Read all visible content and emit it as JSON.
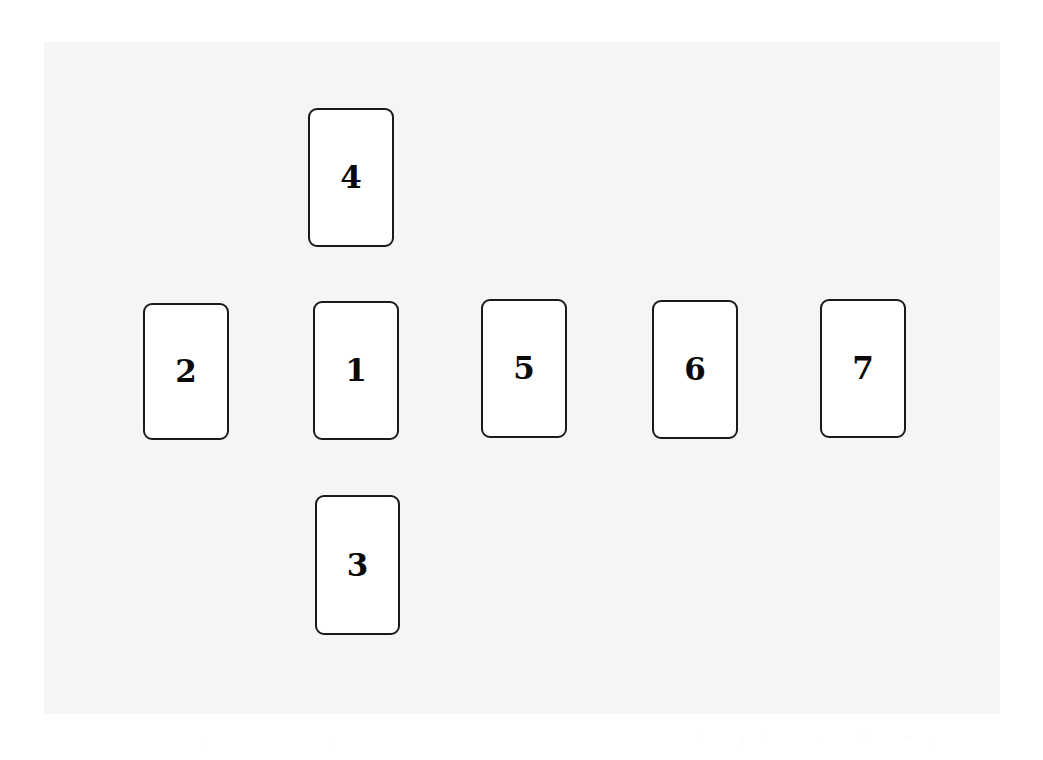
{
  "scene": {
    "type": "card-spread",
    "description": "Seven numbered rectangular cards arranged in a cross layout on a light gray surface",
    "canvas": {
      "width": 1043,
      "height": 760,
      "background_color": "#ffffff"
    },
    "board": {
      "name": "table-surface",
      "background_color": "#f5f5f5",
      "x": 44,
      "y": 42,
      "width": 956,
      "height": 672
    },
    "card_style": {
      "background_color": "#ffffff",
      "border_color": "#1a1a1a",
      "border_width": 2,
      "corner_radius": 9,
      "width": 86,
      "height": 139,
      "label_color": "#0a0a0a",
      "label_font_size": 31
    }
  },
  "cards": [
    {
      "id": "card-4",
      "label": "4",
      "x": 308,
      "y": 108,
      "width": 86,
      "height": 139,
      "column": "center",
      "row": "top"
    },
    {
      "id": "card-2",
      "label": "2",
      "x": 143,
      "y": 303,
      "width": 86,
      "height": 137,
      "column": "left",
      "row": "middle"
    },
    {
      "id": "card-1",
      "label": "1",
      "x": 313,
      "y": 301,
      "width": 86,
      "height": 139,
      "column": "center",
      "row": "middle"
    },
    {
      "id": "card-5",
      "label": "5",
      "x": 481,
      "y": 299,
      "width": 86,
      "height": 139,
      "column": "right-1",
      "row": "middle"
    },
    {
      "id": "card-6",
      "label": "6",
      "x": 652,
      "y": 300,
      "width": 86,
      "height": 139,
      "column": "right-2",
      "row": "middle"
    },
    {
      "id": "card-7",
      "label": "7",
      "x": 820,
      "y": 299,
      "width": 86,
      "height": 139,
      "column": "right-3",
      "row": "middle"
    },
    {
      "id": "card-3",
      "label": "3",
      "x": 315,
      "y": 495,
      "width": 85,
      "height": 140,
      "column": "center",
      "row": "bottom"
    }
  ]
}
